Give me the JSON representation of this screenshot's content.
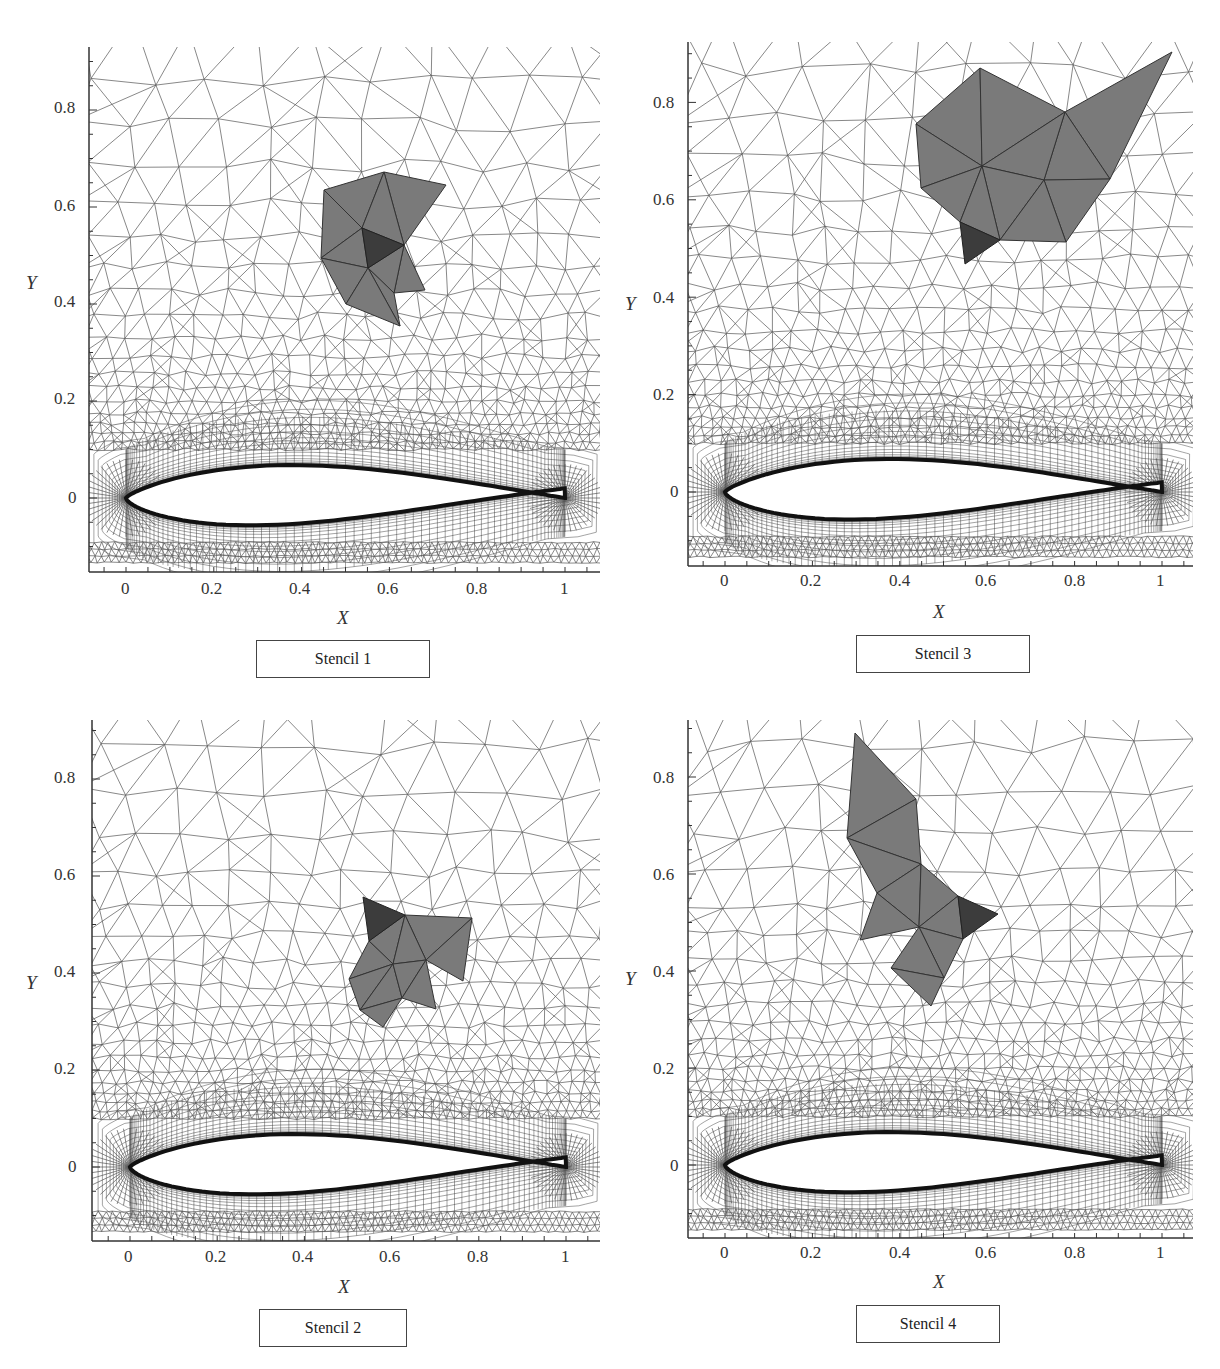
{
  "figure": {
    "panels": [
      {
        "id": "stencil-1",
        "caption": "Stencil 1",
        "xlabel": "X",
        "ylabel": "Y",
        "x_ticks": [
          "0",
          "0.2",
          "0.4",
          "0.6",
          "0.8",
          "1"
        ],
        "y_ticks": [
          "0.8",
          "0.6",
          "0.4",
          "0.2",
          "0"
        ],
        "stencil_description": "Central dark triangle with 9 surrounding gray cells at approx x 0.45-0.73, y 0.36-0.67"
      },
      {
        "id": "stencil-3",
        "caption": "Stencil 3",
        "xlabel": "X",
        "ylabel": "Y",
        "x_ticks": [
          "0",
          "0.2",
          "0.4",
          "0.6",
          "0.8",
          "1"
        ],
        "y_ticks": [
          "0.8",
          "0.6",
          "0.4",
          "0.2",
          "0"
        ],
        "stencil_description": "Dark triangle at approx (0.57, 0.5) with gray cells extending up-right to (1.03, 0.9)"
      },
      {
        "id": "stencil-2",
        "caption": "Stencil 2",
        "xlabel": "X",
        "ylabel": "Y",
        "x_ticks": [
          "0",
          "0.2",
          "0.4",
          "0.6",
          "0.8",
          "1"
        ],
        "y_ticks": [
          "0.8",
          "0.6",
          "0.4",
          "0.2",
          "0"
        ],
        "stencil_description": "Dark triangle at approx (0.58, 0.51) with gray cells extending down-right to (0.77, 0.3)"
      },
      {
        "id": "stencil-4",
        "caption": "Stencil 4",
        "xlabel": "X",
        "ylabel": "Y",
        "x_ticks": [
          "0",
          "0.2",
          "0.4",
          "0.6",
          "0.8",
          "1"
        ],
        "y_ticks": [
          "0.8",
          "0.6",
          "0.4",
          "0.2",
          "0"
        ],
        "stencil_description": "Dark triangle at approx (0.58, 0.52) with gray cells extending up-left to (0.29, 0.89)"
      }
    ],
    "colors": {
      "stencil_fill": "#7a7a7a",
      "stencil_center_fill": "#3c3c3c",
      "mesh_line": "#555555",
      "axis": "#333333"
    }
  }
}
